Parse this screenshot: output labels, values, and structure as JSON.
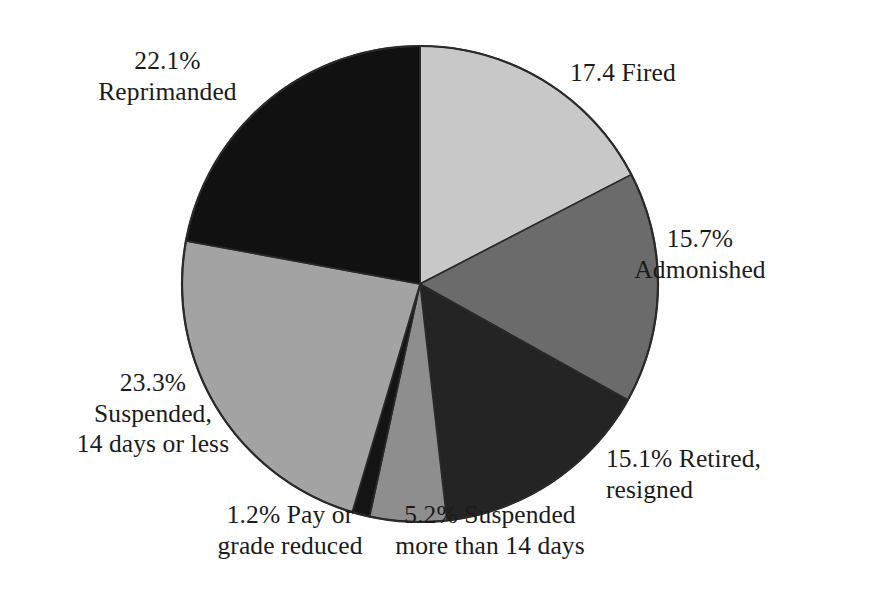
{
  "chart_data": {
    "type": "pie",
    "title": "",
    "subtitle": "",
    "xlabel": "",
    "ylabel": "",
    "legend_position": "none",
    "grid": false,
    "start_angle_deg": 0,
    "direction": "clockwise",
    "units": "percent",
    "categories": [
      "Fired",
      "Admonished",
      "Retired, resigned",
      "Suspended more than 14 days",
      "Pay or grade reduced",
      "Suspended, 14 days or less",
      "Reprimanded"
    ],
    "values": [
      17.4,
      15.7,
      15.1,
      5.2,
      1.2,
      23.3,
      22.1
    ],
    "colors": [
      "#c8c8c8",
      "#6b6b6b",
      "#242424",
      "#8e8e8e",
      "#141414",
      "#a3a3a3",
      "#111111"
    ],
    "slices": [
      {
        "name": "fired",
        "value": 17.4,
        "value_text": "17.4",
        "label_text": "Fired",
        "color": "#c8c8c8",
        "start_deg": 0,
        "end_deg": 62.64
      },
      {
        "name": "admonished",
        "value": 15.7,
        "value_text": "15.7%",
        "label_text": "Admonished",
        "color": "#6b6b6b",
        "start_deg": 62.64,
        "end_deg": 119.16
      },
      {
        "name": "retired-resigned",
        "value": 15.1,
        "value_text": "15.1%",
        "label_text": "Retired, resigned",
        "color": "#242424",
        "start_deg": 119.16,
        "end_deg": 173.52
      },
      {
        "name": "suspended-more-than-14-days",
        "value": 5.2,
        "value_text": "5.2%",
        "label_text": "Suspended more than 14 days",
        "color": "#8e8e8e",
        "start_deg": 173.52,
        "end_deg": 192.24
      },
      {
        "name": "pay-or-grade-reduced",
        "value": 1.2,
        "value_text": "1.2%",
        "label_text": "Pay or grade reduced",
        "color": "#141414",
        "start_deg": 192.24,
        "end_deg": 196.56
      },
      {
        "name": "suspended-14-days-or-less",
        "value": 23.3,
        "value_text": "23.3%",
        "label_text": "Suspended, 14 days or less",
        "color": "#a3a3a3",
        "start_deg": 196.56,
        "end_deg": 280.44
      },
      {
        "name": "reprimanded",
        "value": 22.1,
        "value_text": "22.1%",
        "label_text": "Reprimanded",
        "color": "#111111",
        "start_deg": 280.44,
        "end_deg": 360
      }
    ]
  },
  "labels": {
    "reprimanded": {
      "line1": "22.1%",
      "line2": "Reprimanded"
    },
    "fired": {
      "line1": "17.4 Fired"
    },
    "admonished": {
      "line1": "15.7%",
      "line2": "Admonished"
    },
    "retired": {
      "line1": "15.1% Retired,",
      "line2": "resigned"
    },
    "suspended_more": {
      "line1": "5.2% Suspended",
      "line2": "more than 14 days"
    },
    "pay_grade": {
      "line1": "1.2% Pay or",
      "line2": "grade reduced"
    },
    "suspended_less": {
      "line1": "23.3%",
      "line2": "Suspended,",
      "line3": "14 days or less"
    }
  },
  "geometry": {
    "center_x": 420,
    "center_y": 284,
    "radius": 238,
    "outline_color": "#2a2a2a"
  }
}
